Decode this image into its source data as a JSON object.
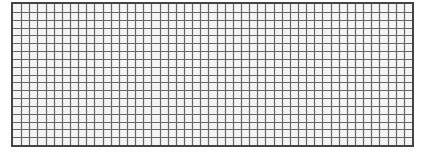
{
  "grid": {
    "columns": 49,
    "rows": 18,
    "line_color": "#666666",
    "border_color": "#444444",
    "cell_color": "#f4f4f4"
  }
}
